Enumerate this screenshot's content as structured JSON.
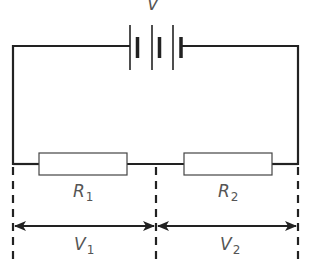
{
  "diagram": {
    "type": "series-circuit",
    "battery": {
      "label": "V",
      "cells": 3
    },
    "resistors": [
      {
        "symbol": "R",
        "subscript": "1"
      },
      {
        "symbol": "R",
        "subscript": "2"
      }
    ],
    "voltages": [
      {
        "symbol": "V",
        "subscript": "1"
      },
      {
        "symbol": "V",
        "subscript": "2"
      }
    ],
    "colors": {
      "wire": "#222222",
      "label": "#555555",
      "background": "#ffffff"
    }
  }
}
